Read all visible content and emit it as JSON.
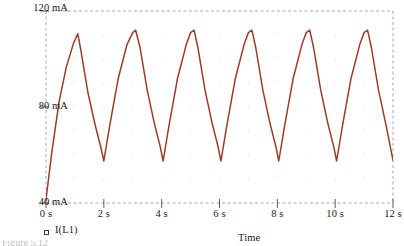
{
  "figure": {
    "trace_color": "#9c3b28",
    "frame_color": "#9aa8c4",
    "grid_color": "#b9b9c9",
    "text_color": "#1a1a1a",
    "caption_partial": "Figure 5.12"
  },
  "legend": {
    "marker": "square-marker",
    "label": "I(L1)"
  },
  "axis": {
    "x_title": "Time",
    "y_labels": [
      "120 mA",
      "80 mA",
      "40 mA"
    ],
    "x_labels": [
      "0 s",
      "2 s",
      "4 s",
      "6 s",
      "8 s",
      "10 s",
      "12 s"
    ]
  },
  "chart_data": {
    "type": "line",
    "title": "",
    "subtitle": "",
    "xlabel": "Time",
    "ylabel": "",
    "xlim": [
      0,
      12
    ],
    "ylim": [
      40,
      120
    ],
    "xunit": "s",
    "yunit": "mA",
    "xticks": [
      0,
      2,
      4,
      6,
      8,
      10,
      12
    ],
    "xticklabels": [
      "0 s",
      "2 s",
      "4 s",
      "6 s",
      "8 s",
      "10 s",
      "12 s"
    ],
    "yticks": [
      40,
      80,
      120
    ],
    "yticklabels": [
      "40 mA",
      "80 mA",
      "120 mA"
    ],
    "grid": "dotted",
    "legend_position": "below-left",
    "series": [
      {
        "name": "I(L1)",
        "color": "#9c3b28",
        "x": [
          0.0,
          0.2,
          0.45,
          0.7,
          0.95,
          1.1,
          1.2,
          1.45,
          1.7,
          1.9,
          2.0,
          2.2,
          2.5,
          2.8,
          3.0,
          3.1,
          3.25,
          3.5,
          3.75,
          3.95,
          4.05,
          4.25,
          4.55,
          4.85,
          5.0,
          5.12,
          5.25,
          5.5,
          5.75,
          5.95,
          6.05,
          6.25,
          6.55,
          6.85,
          7.0,
          7.12,
          7.25,
          7.5,
          7.75,
          7.95,
          8.05,
          8.25,
          8.55,
          8.85,
          9.0,
          9.12,
          9.25,
          9.5,
          9.75,
          9.95,
          10.05,
          10.25,
          10.55,
          10.85,
          11.0,
          11.12,
          11.25,
          11.5,
          11.75,
          12.0
        ],
        "y": [
          41.5,
          61.0,
          82.0,
          96.5,
          106.5,
          110.5,
          104.0,
          86.0,
          72.5,
          63.0,
          57.5,
          72.0,
          92.0,
          106.0,
          111.0,
          112.0,
          105.0,
          87.0,
          73.0,
          63.5,
          57.5,
          72.0,
          92.0,
          106.0,
          111.0,
          112.0,
          105.0,
          87.0,
          73.0,
          63.5,
          57.5,
          72.0,
          92.0,
          106.0,
          111.0,
          112.0,
          105.0,
          87.0,
          73.0,
          63.5,
          57.5,
          72.0,
          92.0,
          106.0,
          111.0,
          112.0,
          105.0,
          87.0,
          73.0,
          63.5,
          57.5,
          72.0,
          92.0,
          106.0,
          111.0,
          112.0,
          105.0,
          87.0,
          73.0,
          57.8
        ]
      }
    ],
    "waveform_description": "sawtooth inductor current ripple, rising ramp with exponential-decay fall, period 2 s",
    "peak_value": 112,
    "valley_value": 57.5,
    "period": 2
  }
}
